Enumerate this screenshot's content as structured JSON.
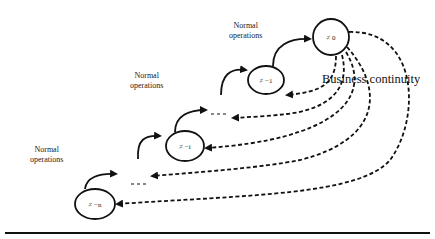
{
  "diagram": {
    "labels": {
      "normal_ops_top": [
        "Normal",
        "operations"
      ],
      "normal_ops_upper_mid": [
        "Normal",
        "operations"
      ],
      "normal_ops_left": [
        "Normal",
        "operations"
      ],
      "business_continuity": "Business continuity"
    },
    "nodes": [
      {
        "id": "n0",
        "label": "≠ 0"
      },
      {
        "id": "n1",
        "label": "≠ −1"
      },
      {
        "id": "ni",
        "label": "≠ −i"
      },
      {
        "id": "nn",
        "label": "≠ −n"
      }
    ],
    "ellipsis": [
      "- - -",
      "- - -"
    ],
    "edges": {
      "normal_operations": "solid arrows stepping upward from ≠ −n to ≠ 0",
      "business_continuity": "dashed arrows from ≠ 0 back to each earlier state"
    },
    "colors": {
      "ink": "#111111",
      "background": "#ffffff"
    }
  }
}
